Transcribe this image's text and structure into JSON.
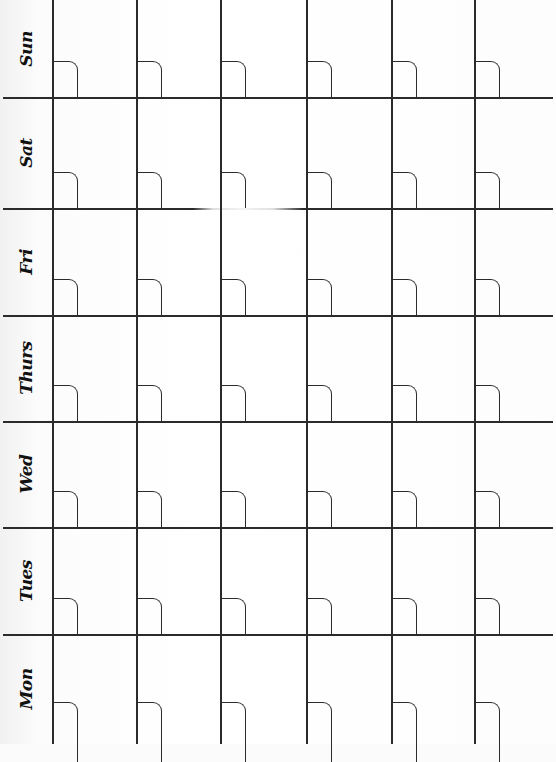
{
  "planner": {
    "type": "weekly-calendar-grid",
    "days": [
      {
        "label": "Sun"
      },
      {
        "label": "Sat"
      },
      {
        "label": "Fri"
      },
      {
        "label": "Thurs"
      },
      {
        "label": "Wed"
      },
      {
        "label": "Tues"
      },
      {
        "label": "Mon"
      }
    ],
    "columns": 6,
    "line_color": "#2b2b2b",
    "background_color": "#ffffff"
  }
}
